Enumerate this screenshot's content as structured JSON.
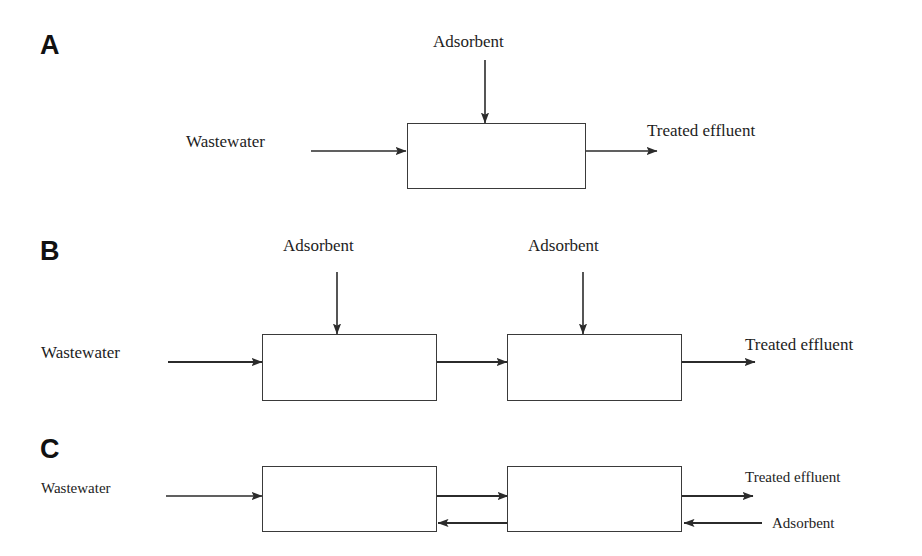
{
  "figure": {
    "background_color": "#ffffff",
    "line_color": "#2b2b2b",
    "text_color": "#1d1d1d"
  },
  "panels": [
    {
      "label": "A",
      "scheme": "single-stage adsorption",
      "inlet_label": "Wastewater",
      "adsorbent_labels": [
        "Adsorbent"
      ],
      "outlet_label": "Treated effluent",
      "vessel_count": 1
    },
    {
      "label": "B",
      "scheme": "two-stage cross-current adsorption",
      "inlet_label": "Wastewater",
      "adsorbent_labels": [
        "Adsorbent",
        "Adsorbent"
      ],
      "outlet_label": "Treated effluent",
      "vessel_count": 2
    },
    {
      "label": "C",
      "scheme": "two-stage counter-current adsorption",
      "inlet_label": "Wastewater",
      "adsorbent_labels": [
        "Adsorbent"
      ],
      "outlet_label": "Treated effluent",
      "vessel_count": 2
    }
  ],
  "panel_a": {
    "label": "A",
    "wastewater": "Wastewater",
    "adsorbent": "Adsorbent",
    "treated_effluent": "Treated effluent"
  },
  "panel_b": {
    "label": "B",
    "wastewater": "Wastewater",
    "adsorbent_1": "Adsorbent",
    "adsorbent_2": "Adsorbent",
    "treated_effluent": "Treated effluent"
  },
  "panel_c": {
    "label": "C",
    "wastewater": "Wastewater",
    "adsorbent": "Adsorbent",
    "treated_effluent": "Treated effluent"
  }
}
